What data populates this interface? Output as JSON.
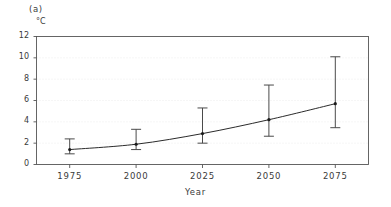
{
  "chart_data": {
    "type": "line",
    "title": "",
    "panel_label": "(a)",
    "xlabel": "Year",
    "ylabel": "",
    "unit_label": "°C",
    "x": [
      1975,
      2000,
      2025,
      2050,
      2075
    ],
    "categories": [
      "1975",
      "2000",
      "2025",
      "2050",
      "2075"
    ],
    "values": [
      1.4,
      1.9,
      2.9,
      4.2,
      5.7
    ],
    "error_low": [
      1.0,
      1.4,
      2.0,
      2.65,
      3.45
    ],
    "error_high": [
      2.4,
      3.3,
      5.3,
      7.45,
      10.1
    ],
    "series": [
      {
        "name": "Temperature change",
        "values": [
          1.4,
          1.9,
          2.9,
          4.2,
          5.7
        ],
        "error_low": [
          1.0,
          1.4,
          2.0,
          2.65,
          3.45
        ],
        "error_high": [
          2.4,
          3.3,
          5.3,
          7.45,
          10.1
        ]
      }
    ],
    "ylim": [
      0,
      12
    ],
    "xlim": [
      1962.5,
      2087.5
    ],
    "yticks": [
      0,
      2,
      4,
      6,
      8,
      10,
      12
    ],
    "ytick_labels": [
      "0",
      "2",
      "4",
      "6",
      "8",
      "10",
      "12"
    ],
    "xticks": [
      1975,
      2000,
      2025,
      2050,
      2075
    ],
    "xtick_labels": [
      "1975",
      "2000",
      "2025",
      "2050",
      "2075"
    ],
    "grid": true,
    "grid_axis": "y",
    "grid_style": "dotted",
    "legend": false,
    "legend_position": "none",
    "marker": "dot",
    "errorbar_caps": true,
    "colors": {
      "line": "#2b2b2b",
      "marker": "#1a1a1a",
      "errorbar": "#4a4a4a",
      "axis": "#555555",
      "grid": "#e8e8e8",
      "text": "#3a3a3a",
      "background": "#ffffff"
    }
  }
}
